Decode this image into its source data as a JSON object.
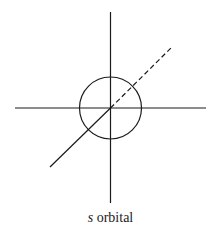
{
  "figure": {
    "caption_symbol": "s",
    "caption_text": " orbital",
    "stroke_color": "#1a1a1a",
    "background": "#ffffff",
    "elements": {
      "z_axis": "vertical axis line",
      "x_axis": "horizontal axis line",
      "y_axis_front": "solid diagonal axis (front)",
      "y_axis_back": "dashed diagonal axis (behind)",
      "orbital": "circle representing spherical s orbital"
    }
  }
}
